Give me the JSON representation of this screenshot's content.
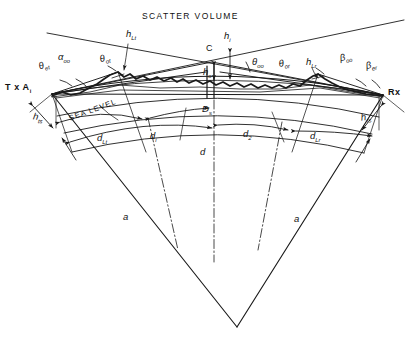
{
  "figure": {
    "title": "SCATTER VOLUME",
    "type": "troposcatter-path-geometry-diagram",
    "stroke_color": "#1a1a1a",
    "background_color": "#ffffff"
  },
  "terminals": {
    "transmitter": "T x A",
    "transmitter_sub": "i",
    "receiver": "Rx"
  },
  "labels": {
    "scatter_volume": "SCATTER VOLUME",
    "sea_level": "SEA LEVEL",
    "crossover_point": "C"
  },
  "angles": {
    "theta_et": {
      "base": "θ",
      "sub": "et"
    },
    "alpha_oo": {
      "base": "α",
      "sub": "oo"
    },
    "theta_ot": {
      "base": "θ",
      "sub": "ot"
    },
    "theta_oo": {
      "base": "θ",
      "sub": "oo"
    },
    "theta_or": {
      "base": "θ",
      "sub": "or"
    },
    "beta_oo": {
      "base": "β",
      "sub": "oo"
    },
    "beta_er": {
      "base": "β",
      "sub": "er"
    }
  },
  "heights": {
    "h_Lt": {
      "base": "h",
      "sub": "Lt"
    },
    "h_i": {
      "base": "h",
      "sub": "i"
    },
    "h_o": {
      "base": "h",
      "sub": "o"
    },
    "h_Lr": {
      "base": "h",
      "sub": "Lr"
    },
    "h_ts": {
      "base": "h",
      "sub": "ts"
    },
    "h_rs": {
      "base": "h",
      "sub": "rs"
    }
  },
  "distances": {
    "D_s": {
      "base": "D",
      "sub": "s"
    },
    "d_Lt": {
      "base": "d",
      "sub": "Lt"
    },
    "d_i": {
      "base": "d",
      "sub": "i"
    },
    "d": {
      "base": "d",
      "sub": ""
    },
    "d_2": {
      "base": "d",
      "sub": "2"
    },
    "d_Lr": {
      "base": "d",
      "sub": "Lr"
    },
    "a_left": {
      "base": "a",
      "sub": ""
    },
    "a_right": {
      "base": "a",
      "sub": ""
    }
  }
}
